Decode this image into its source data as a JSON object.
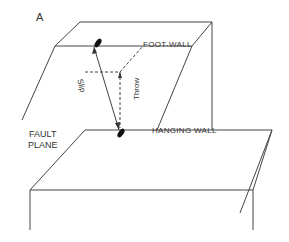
{
  "figure": {
    "panel_label": "A",
    "labels": {
      "foot_wall": "FOOT-WALL",
      "hanging_wall": "HANGING WALL",
      "fault_plane_line1": "FAULT",
      "fault_plane_line2": "PLANE",
      "slip": "Slip",
      "throw": "Throw"
    },
    "colors": {
      "line": "#444444",
      "background": "#ffffff"
    }
  }
}
